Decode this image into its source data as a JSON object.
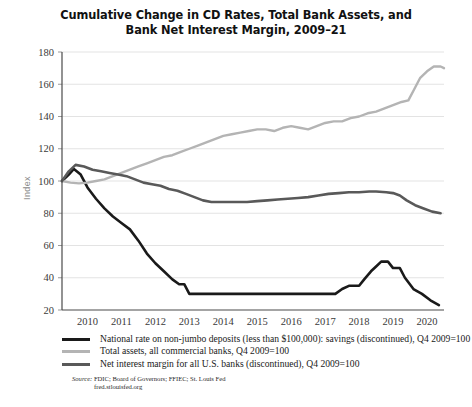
{
  "chart_data": {
    "type": "line",
    "title": "Cumulative Change in CD Rates, Total Bank Assets, and Bank Net Interest Margin, 2009–21",
    "title_line1": "Cumulative Change in CD Rates, Total Bank Assets, and",
    "title_line2": "Bank Net Interest Margin, 2009–21",
    "xlabel": "",
    "ylabel": "Index",
    "ylim": [
      20,
      180
    ],
    "xlim": [
      2009.75,
      2021.0
    ],
    "yticks": [
      20,
      40,
      60,
      80,
      100,
      120,
      140,
      160,
      180
    ],
    "xticks": [
      2010,
      2011,
      2012,
      2013,
      2014,
      2015,
      2016,
      2017,
      2018,
      2019,
      2020
    ],
    "grid": true,
    "grid_axis": "y",
    "legend_position": "below",
    "series": [
      {
        "name": "National rate on non-jumbo deposits (less than $100,000): savings (discontinued), Q4 2009=100",
        "short_name": "cd-rates",
        "color": "#1a1a1a",
        "width": 2.6,
        "points": [
          [
            2009.75,
            100
          ],
          [
            2009.95,
            104
          ],
          [
            2010.1,
            107.5
          ],
          [
            2010.3,
            104
          ],
          [
            2010.5,
            96
          ],
          [
            2010.75,
            89
          ],
          [
            2011.0,
            83
          ],
          [
            2011.25,
            78
          ],
          [
            2011.5,
            74
          ],
          [
            2011.75,
            70
          ],
          [
            2012.0,
            63
          ],
          [
            2012.25,
            55
          ],
          [
            2012.5,
            49
          ],
          [
            2012.75,
            44
          ],
          [
            2013.0,
            39
          ],
          [
            2013.2,
            36
          ],
          [
            2013.35,
            36
          ],
          [
            2013.5,
            30
          ],
          [
            2013.75,
            30
          ],
          [
            2014.0,
            30
          ],
          [
            2015.0,
            30
          ],
          [
            2016.0,
            30
          ],
          [
            2017.0,
            30
          ],
          [
            2017.8,
            30
          ],
          [
            2018.0,
            33
          ],
          [
            2018.2,
            35
          ],
          [
            2018.5,
            35
          ],
          [
            2018.65,
            39
          ],
          [
            2018.85,
            44
          ],
          [
            2019.0,
            47
          ],
          [
            2019.15,
            50
          ],
          [
            2019.35,
            50
          ],
          [
            2019.5,
            46
          ],
          [
            2019.7,
            46
          ],
          [
            2019.85,
            40
          ],
          [
            2020.1,
            33
          ],
          [
            2020.35,
            30
          ],
          [
            2020.6,
            26
          ],
          [
            2020.85,
            23
          ]
        ]
      },
      {
        "name": "Total assets, all commercial banks, Q4 2009=100",
        "short_name": "total-assets",
        "color": "#b4b4b4",
        "width": 2.4,
        "points": [
          [
            2009.75,
            100
          ],
          [
            2010.0,
            99
          ],
          [
            2010.25,
            98.5
          ],
          [
            2010.5,
            99
          ],
          [
            2010.75,
            100
          ],
          [
            2011.0,
            101
          ],
          [
            2011.25,
            103
          ],
          [
            2011.5,
            105
          ],
          [
            2011.75,
            107
          ],
          [
            2012.0,
            109
          ],
          [
            2012.25,
            111
          ],
          [
            2012.5,
            113
          ],
          [
            2012.75,
            115
          ],
          [
            2013.0,
            116
          ],
          [
            2013.25,
            118
          ],
          [
            2013.5,
            120
          ],
          [
            2013.75,
            122
          ],
          [
            2014.0,
            124
          ],
          [
            2014.25,
            126
          ],
          [
            2014.5,
            128
          ],
          [
            2014.75,
            129
          ],
          [
            2015.0,
            130
          ],
          [
            2015.25,
            131
          ],
          [
            2015.5,
            132
          ],
          [
            2015.75,
            132
          ],
          [
            2016.0,
            131
          ],
          [
            2016.25,
            133
          ],
          [
            2016.5,
            134
          ],
          [
            2016.75,
            133
          ],
          [
            2017.0,
            132
          ],
          [
            2017.25,
            134
          ],
          [
            2017.5,
            136
          ],
          [
            2017.75,
            137
          ],
          [
            2018.0,
            137
          ],
          [
            2018.25,
            139
          ],
          [
            2018.5,
            140
          ],
          [
            2018.75,
            142
          ],
          [
            2019.0,
            143
          ],
          [
            2019.25,
            145
          ],
          [
            2019.5,
            147
          ],
          [
            2019.75,
            149
          ],
          [
            2019.95,
            150
          ],
          [
            2020.1,
            156
          ],
          [
            2020.3,
            164
          ],
          [
            2020.5,
            168
          ],
          [
            2020.7,
            171
          ],
          [
            2020.9,
            171
          ],
          [
            2021.0,
            170
          ]
        ]
      },
      {
        "name": "Net interest margin for all U.S. banks (discontinued), Q4 2009=100",
        "short_name": "net-interest-margin",
        "color": "#595959",
        "width": 2.6,
        "points": [
          [
            2009.75,
            100
          ],
          [
            2009.95,
            106
          ],
          [
            2010.15,
            110
          ],
          [
            2010.4,
            109
          ],
          [
            2010.65,
            107
          ],
          [
            2010.9,
            106
          ],
          [
            2011.15,
            105
          ],
          [
            2011.4,
            104
          ],
          [
            2011.65,
            103
          ],
          [
            2011.9,
            101
          ],
          [
            2012.15,
            99
          ],
          [
            2012.4,
            98
          ],
          [
            2012.65,
            97
          ],
          [
            2012.9,
            95
          ],
          [
            2013.15,
            94
          ],
          [
            2013.4,
            92
          ],
          [
            2013.65,
            90
          ],
          [
            2013.9,
            88
          ],
          [
            2014.15,
            87
          ],
          [
            2014.4,
            87
          ],
          [
            2014.65,
            87
          ],
          [
            2014.9,
            87
          ],
          [
            2015.2,
            87
          ],
          [
            2015.5,
            87.5
          ],
          [
            2015.8,
            88
          ],
          [
            2016.1,
            88.5
          ],
          [
            2016.4,
            89
          ],
          [
            2016.7,
            89.5
          ],
          [
            2017.0,
            90
          ],
          [
            2017.3,
            91
          ],
          [
            2017.6,
            92
          ],
          [
            2017.9,
            92.5
          ],
          [
            2018.2,
            93
          ],
          [
            2018.5,
            93
          ],
          [
            2018.8,
            93.5
          ],
          [
            2019.0,
            93.5
          ],
          [
            2019.3,
            93
          ],
          [
            2019.5,
            92.5
          ],
          [
            2019.7,
            91
          ],
          [
            2019.9,
            88
          ],
          [
            2020.15,
            85
          ],
          [
            2020.4,
            83
          ],
          [
            2020.65,
            81
          ],
          [
            2020.9,
            80
          ]
        ]
      }
    ]
  },
  "legend": {
    "items": [
      {
        "label": "National rate on non-jumbo deposits (less than $100,000): savings (discontinued), Q4 2009=100",
        "color": "#1a1a1a"
      },
      {
        "label": "Total assets, all commercial banks, Q4 2009=100",
        "color": "#b4b4b4"
      },
      {
        "label": "Net interest margin for all U.S. banks (discontinued), Q4 2009=100",
        "color": "#595959"
      }
    ]
  },
  "source": {
    "prefix": "Source:",
    "text": "FDIC; Board of Governors; FFIEC; St. Louis Fed",
    "url_line": "fred.stlouisfed.org"
  }
}
